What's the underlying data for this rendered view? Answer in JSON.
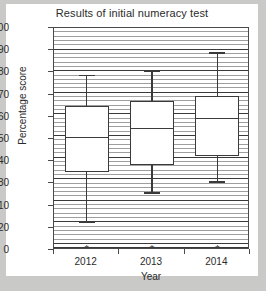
{
  "chart_data": {
    "type": "box",
    "title": "Results of initial numeracy test",
    "xlabel": "Year",
    "ylabel": "Percentage score",
    "categories": [
      "2012",
      "2013",
      "2014"
    ],
    "ylim": [
      0,
      100
    ],
    "ytick_labels": [
      "100",
      "90",
      "80",
      "70",
      "60",
      "50",
      "40",
      "30",
      "10",
      "20",
      "0"
    ],
    "ytick_values": [
      100,
      90,
      80,
      70,
      60,
      50,
      40,
      30,
      20,
      10,
      0
    ],
    "grid": true,
    "legend": "none",
    "series": [
      {
        "name": "2012",
        "min": 13,
        "q1": 35,
        "median": 51,
        "q3": 65,
        "max": 79,
        "outliers": [
          0
        ],
        "outlier_marker": "*"
      },
      {
        "name": "2013",
        "min": 26,
        "q1": 38.5,
        "median": 55,
        "q3": 67,
        "max": 81,
        "outliers": [
          0
        ],
        "outlier_marker": "*"
      },
      {
        "name": "2014",
        "min": 31,
        "q1": 42.5,
        "median": 59.5,
        "q3": 69.5,
        "max": 89,
        "outliers": [
          0
        ],
        "outlier_marker": "*"
      }
    ],
    "colors": {
      "box_fill": "#ffffff",
      "box_line": "#3a3a3a",
      "grid_line": "#8d8d8d",
      "axis": "#4a4a4a",
      "text": "#2b2b2b",
      "card_background": "#ffffff",
      "page_background": "#c9c9c7"
    }
  }
}
